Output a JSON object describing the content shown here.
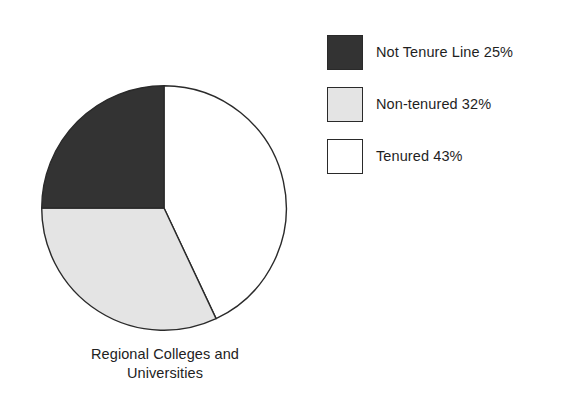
{
  "chart_data": {
    "type": "pie",
    "title": "",
    "caption_lines": [
      "Regional Colleges and",
      "Universities"
    ],
    "caption_text": "Regional Colleges and Universities",
    "start_angle_deg": 0,
    "direction": "clockwise",
    "categories": [
      "Tenured",
      "Non-tenured",
      "Not Tenure Line"
    ],
    "values": [
      43,
      32,
      25
    ],
    "units": "percent",
    "slices": [
      {
        "label": "Tenured",
        "value": 43,
        "display": "Tenured 43%",
        "color": "#ffffff",
        "edge_color": "#2a2a2a",
        "start_deg": 0,
        "end_deg": 154.8
      },
      {
        "label": "Non-tenured",
        "value": 32,
        "display": "Non-tenured 32%",
        "color": "#e4e4e4",
        "edge_color": "#2a2a2a",
        "start_deg": 154.8,
        "end_deg": 270.0
      },
      {
        "label": "Not Tenure Line",
        "value": 25,
        "display": "Not Tenure Line 25%",
        "color": "#333333",
        "edge_color": "#2a2a2a",
        "start_deg": 270.0,
        "end_deg": 360.0
      }
    ],
    "legend": {
      "position": "right",
      "entries": [
        {
          "label": "Not Tenure Line 25%",
          "color": "#333333",
          "swatch": "dark-gray-swatch"
        },
        {
          "label": "Non-tenured 32%",
          "color": "#e4e4e4",
          "swatch": "light-gray-swatch"
        },
        {
          "label": "Tenured 43%",
          "color": "#ffffff",
          "swatch": "white-swatch"
        }
      ]
    },
    "grid": false,
    "xlabel": "",
    "ylabel": ""
  },
  "colors": {
    "background": "#ffffff",
    "outline": "#2a2a2a",
    "text": "#1f1f1f",
    "dark_slice": "#333333",
    "light_slice": "#e4e4e4",
    "white_slice": "#ffffff"
  }
}
